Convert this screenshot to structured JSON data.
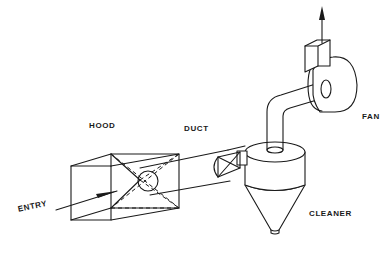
{
  "diagram": {
    "type": "local exhaust ventilation system",
    "labels": {
      "hood": "HOOD",
      "duct": "DUCT",
      "fan": "FAN",
      "cleaner": "CLEANER",
      "entry": "ENTRY"
    },
    "components": [
      "hood",
      "duct",
      "cleaner",
      "fan"
    ],
    "flow_direction": [
      "entry",
      "hood",
      "duct",
      "cleaner",
      "fan",
      "exhaust"
    ],
    "colors": {
      "line": "#1a1a1a",
      "background": "#ffffff"
    }
  }
}
